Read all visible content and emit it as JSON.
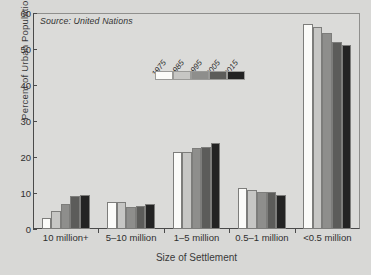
{
  "chart_data": {
    "type": "bar",
    "title": "",
    "subtitle": "",
    "xlabel": "Size of Settlement",
    "ylabel": "Percent of Urban Population",
    "ylim": [
      0,
      60
    ],
    "yticks": [
      0,
      10,
      20,
      30,
      40,
      50,
      60
    ],
    "grid": false,
    "legend_position": "inside-top-center",
    "annotation": "Source: United Nations",
    "categories": [
      "10 million+",
      "5–10 million",
      "1–5 million",
      "0.5–1 million",
      "<0.5 million"
    ],
    "series": [
      {
        "name": "1975",
        "color": "#fbfbf9",
        "values": [
          3.1,
          7.5,
          21.3,
          11.5,
          57.0
        ]
      },
      {
        "name": "1985",
        "color": "#c6c6c4",
        "values": [
          4.9,
          7.5,
          21.5,
          10.7,
          56.0
        ]
      },
      {
        "name": "1995",
        "color": "#8e8e8c",
        "values": [
          6.9,
          6.0,
          22.5,
          10.4,
          54.5
        ]
      },
      {
        "name": "2005",
        "color": "#5c5c5a",
        "values": [
          9.3,
          6.3,
          22.8,
          10.3,
          52.0
        ]
      },
      {
        "name": "2015",
        "color": "#232323",
        "values": [
          9.5,
          7.0,
          24.0,
          9.4,
          51.0
        ]
      }
    ]
  }
}
